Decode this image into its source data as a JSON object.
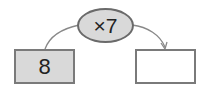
{
  "diagram": {
    "operator": "×7",
    "input_value": "8",
    "output_value": "",
    "colors": {
      "input_fill": "#d9d9d9",
      "output_fill": "#ffffff",
      "operator_fill": "#d9d9d9",
      "border": "#7a7a7a"
    }
  }
}
